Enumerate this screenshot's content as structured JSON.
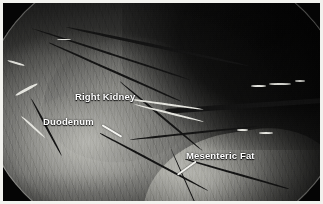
{
  "image": {
    "modality": "laparoscopic-endoscopic-view",
    "palette": "grayscale",
    "border_color": "#f2f2ee",
    "background_color": "#050505"
  },
  "annotations": {
    "label_color": "#ffffff",
    "pointer_color": "#f4f4f0",
    "items": [
      {
        "id": "right-kidney",
        "label": "Right Kidney",
        "has_pointer": false
      },
      {
        "id": "duodenum",
        "label": "Duodenum",
        "has_pointer": true
      },
      {
        "id": "mesenteric-fat",
        "label": "Mesenteric Fat",
        "has_pointer": true
      }
    ]
  }
}
